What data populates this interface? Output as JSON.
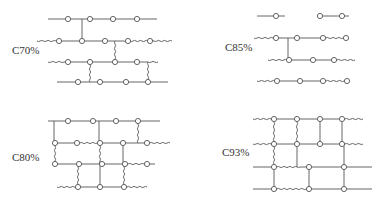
{
  "figure": {
    "colors": {
      "line": "#555555",
      "node_fill": "#ffffff",
      "text": "#333333"
    },
    "node_radius": 2.6,
    "panels": [
      {
        "id": "c70",
        "label": "C70%",
        "label_pos": [
          12,
          54
        ],
        "segments": [
          {
            "x1": 48,
            "y1": 19,
            "x2": 157,
            "y2": 19,
            "type": "straight"
          },
          {
            "x1": 37,
            "y1": 41,
            "x2": 56,
            "y2": 41,
            "type": "wavy"
          },
          {
            "x1": 56,
            "y1": 41,
            "x2": 124,
            "y2": 41,
            "type": "straight"
          },
          {
            "x1": 124,
            "y1": 41,
            "x2": 172,
            "y2": 41,
            "type": "wavy"
          },
          {
            "x1": 48,
            "y1": 62,
            "x2": 64,
            "y2": 62,
            "type": "wavy"
          },
          {
            "x1": 64,
            "y1": 62,
            "x2": 148,
            "y2": 62,
            "type": "straight"
          },
          {
            "x1": 148,
            "y1": 62,
            "x2": 158,
            "y2": 62,
            "type": "wavy"
          },
          {
            "x1": 57,
            "y1": 82,
            "x2": 168,
            "y2": 82,
            "type": "straight"
          },
          {
            "x1": 82,
            "y1": 19,
            "x2": 82,
            "y2": 41,
            "type": "straight"
          },
          {
            "x1": 115,
            "y1": 41,
            "x2": 115,
            "y2": 62,
            "type": "wavy"
          },
          {
            "x1": 90,
            "y1": 62,
            "x2": 90,
            "y2": 82,
            "type": "wavy"
          },
          {
            "x1": 148,
            "y1": 62,
            "x2": 148,
            "y2": 82,
            "type": "wavy"
          }
        ],
        "nodes": [
          [
            68,
            19
          ],
          [
            90,
            19
          ],
          [
            113,
            19
          ],
          [
            137,
            19
          ],
          [
            59,
            41
          ],
          [
            82,
            41
          ],
          [
            105,
            41
          ],
          [
            128,
            41
          ],
          [
            150,
            41
          ],
          [
            68,
            62
          ],
          [
            90,
            62
          ],
          [
            115,
            62
          ],
          [
            137,
            62
          ],
          [
            78,
            82
          ],
          [
            100,
            82
          ],
          [
            126,
            82
          ],
          [
            148,
            82
          ]
        ]
      },
      {
        "id": "c85",
        "label": "C85%",
        "label_pos": [
          225,
          51
        ],
        "segments": [
          {
            "x1": 257,
            "y1": 16,
            "x2": 285,
            "y2": 16,
            "type": "straight"
          },
          {
            "x1": 317,
            "y1": 16,
            "x2": 349,
            "y2": 16,
            "type": "straight"
          },
          {
            "x1": 254,
            "y1": 38,
            "x2": 273,
            "y2": 38,
            "type": "wavy"
          },
          {
            "x1": 273,
            "y1": 38,
            "x2": 323,
            "y2": 38,
            "type": "straight"
          },
          {
            "x1": 323,
            "y1": 38,
            "x2": 346,
            "y2": 38,
            "type": "wavy"
          },
          {
            "x1": 268,
            "y1": 60,
            "x2": 287,
            "y2": 60,
            "type": "wavy"
          },
          {
            "x1": 287,
            "y1": 60,
            "x2": 334,
            "y2": 60,
            "type": "straight"
          },
          {
            "x1": 334,
            "y1": 60,
            "x2": 355,
            "y2": 60,
            "type": "wavy"
          },
          {
            "x1": 257,
            "y1": 81,
            "x2": 275,
            "y2": 81,
            "type": "wavy"
          },
          {
            "x1": 275,
            "y1": 81,
            "x2": 323,
            "y2": 81,
            "type": "straight"
          },
          {
            "x1": 323,
            "y1": 81,
            "x2": 347,
            "y2": 81,
            "type": "wavy"
          },
          {
            "x1": 288,
            "y1": 38,
            "x2": 288,
            "y2": 60,
            "type": "straight"
          }
        ],
        "nodes": [
          [
            276,
            16
          ],
          [
            320,
            16
          ],
          [
            342,
            16
          ],
          [
            276,
            38
          ],
          [
            297,
            38
          ],
          [
            323,
            38
          ],
          [
            346,
            38
          ],
          [
            289,
            60
          ],
          [
            313,
            60
          ],
          [
            334,
            60
          ],
          [
            277,
            81
          ],
          [
            300,
            81
          ],
          [
            323,
            81
          ],
          [
            347,
            81
          ]
        ]
      },
      {
        "id": "c80",
        "label": "C80%",
        "label_pos": [
          12,
          161
        ],
        "segments": [
          {
            "x1": 48,
            "y1": 121,
            "x2": 160,
            "y2": 121,
            "type": "straight"
          },
          {
            "x1": 54,
            "y1": 143,
            "x2": 77,
            "y2": 143,
            "type": "straight"
          },
          {
            "x1": 77,
            "y1": 143,
            "x2": 100,
            "y2": 143,
            "type": "wavy"
          },
          {
            "x1": 100,
            "y1": 143,
            "x2": 147,
            "y2": 143,
            "type": "straight"
          },
          {
            "x1": 147,
            "y1": 143,
            "x2": 170,
            "y2": 143,
            "type": "wavy"
          },
          {
            "x1": 54,
            "y1": 164,
            "x2": 125,
            "y2": 164,
            "type": "straight"
          },
          {
            "x1": 125,
            "y1": 164,
            "x2": 147,
            "y2": 164,
            "type": "wavy"
          },
          {
            "x1": 147,
            "y1": 164,
            "x2": 155,
            "y2": 164,
            "type": "straight"
          },
          {
            "x1": 57,
            "y1": 187,
            "x2": 77,
            "y2": 187,
            "type": "wavy"
          },
          {
            "x1": 77,
            "y1": 187,
            "x2": 124,
            "y2": 187,
            "type": "straight"
          },
          {
            "x1": 124,
            "y1": 187,
            "x2": 147,
            "y2": 187,
            "type": "wavy"
          },
          {
            "x1": 54,
            "y1": 121,
            "x2": 54,
            "y2": 143,
            "type": "straight"
          },
          {
            "x1": 99,
            "y1": 121,
            "x2": 99,
            "y2": 143,
            "type": "straight"
          },
          {
            "x1": 138,
            "y1": 121,
            "x2": 138,
            "y2": 143,
            "type": "wavy"
          },
          {
            "x1": 55,
            "y1": 143,
            "x2": 55,
            "y2": 164,
            "type": "wavy"
          },
          {
            "x1": 100,
            "y1": 143,
            "x2": 100,
            "y2": 164,
            "type": "wavy"
          },
          {
            "x1": 123,
            "y1": 143,
            "x2": 123,
            "y2": 164,
            "type": "straight"
          },
          {
            "x1": 78,
            "y1": 164,
            "x2": 78,
            "y2": 187,
            "type": "wavy"
          },
          {
            "x1": 100,
            "y1": 164,
            "x2": 100,
            "y2": 187,
            "type": "straight"
          },
          {
            "x1": 124,
            "y1": 164,
            "x2": 124,
            "y2": 187,
            "type": "wavy"
          }
        ],
        "nodes": [
          [
            68,
            121
          ],
          [
            93,
            121
          ],
          [
            116,
            121
          ],
          [
            138,
            121
          ],
          [
            55,
            143
          ],
          [
            77,
            143
          ],
          [
            100,
            143
          ],
          [
            123,
            143
          ],
          [
            147,
            143
          ],
          [
            55,
            164
          ],
          [
            79,
            164
          ],
          [
            102,
            164
          ],
          [
            125,
            164
          ],
          [
            147,
            164
          ],
          [
            78,
            187
          ],
          [
            100,
            187
          ],
          [
            124,
            187
          ]
        ]
      },
      {
        "id": "c93",
        "label": "C93%",
        "label_pos": [
          222,
          156
        ],
        "segments": [
          {
            "x1": 253,
            "y1": 119,
            "x2": 274,
            "y2": 119,
            "type": "wavy"
          },
          {
            "x1": 274,
            "y1": 119,
            "x2": 342,
            "y2": 119,
            "type": "straight"
          },
          {
            "x1": 342,
            "y1": 119,
            "x2": 363,
            "y2": 119,
            "type": "wavy"
          },
          {
            "x1": 253,
            "y1": 144,
            "x2": 274,
            "y2": 144,
            "type": "wavy"
          },
          {
            "x1": 274,
            "y1": 144,
            "x2": 342,
            "y2": 144,
            "type": "straight"
          },
          {
            "x1": 342,
            "y1": 144,
            "x2": 363,
            "y2": 144,
            "type": "wavy"
          },
          {
            "x1": 253,
            "y1": 167,
            "x2": 274,
            "y2": 167,
            "type": "straight"
          },
          {
            "x1": 274,
            "y1": 167,
            "x2": 300,
            "y2": 167,
            "type": "wavy"
          },
          {
            "x1": 300,
            "y1": 167,
            "x2": 372,
            "y2": 167,
            "type": "straight"
          },
          {
            "x1": 253,
            "y1": 189,
            "x2": 274,
            "y2": 189,
            "type": "straight"
          },
          {
            "x1": 274,
            "y1": 189,
            "x2": 309,
            "y2": 189,
            "type": "wavy"
          },
          {
            "x1": 309,
            "y1": 189,
            "x2": 372,
            "y2": 189,
            "type": "straight"
          },
          {
            "x1": 274,
            "y1": 119,
            "x2": 274,
            "y2": 144,
            "type": "wavy"
          },
          {
            "x1": 274,
            "y1": 144,
            "x2": 274,
            "y2": 167,
            "type": "wavy"
          },
          {
            "x1": 274,
            "y1": 167,
            "x2": 274,
            "y2": 189,
            "type": "straight"
          },
          {
            "x1": 297,
            "y1": 119,
            "x2": 297,
            "y2": 144,
            "type": "wavy"
          },
          {
            "x1": 297,
            "y1": 144,
            "x2": 297,
            "y2": 167,
            "type": "straight"
          },
          {
            "x1": 320,
            "y1": 119,
            "x2": 320,
            "y2": 144,
            "type": "straight"
          },
          {
            "x1": 342,
            "y1": 119,
            "x2": 342,
            "y2": 144,
            "type": "straight"
          },
          {
            "x1": 344,
            "y1": 144,
            "x2": 344,
            "y2": 189,
            "type": "straight"
          },
          {
            "x1": 309,
            "y1": 167,
            "x2": 309,
            "y2": 189,
            "type": "straight"
          }
        ],
        "nodes": [
          [
            274,
            119
          ],
          [
            297,
            119
          ],
          [
            320,
            119
          ],
          [
            342,
            119
          ],
          [
            274,
            144
          ],
          [
            297,
            144
          ],
          [
            320,
            144
          ],
          [
            342,
            144
          ],
          [
            274,
            167
          ],
          [
            309,
            167
          ],
          [
            344,
            167
          ],
          [
            274,
            189
          ],
          [
            309,
            189
          ],
          [
            344,
            189
          ]
        ]
      }
    ]
  }
}
